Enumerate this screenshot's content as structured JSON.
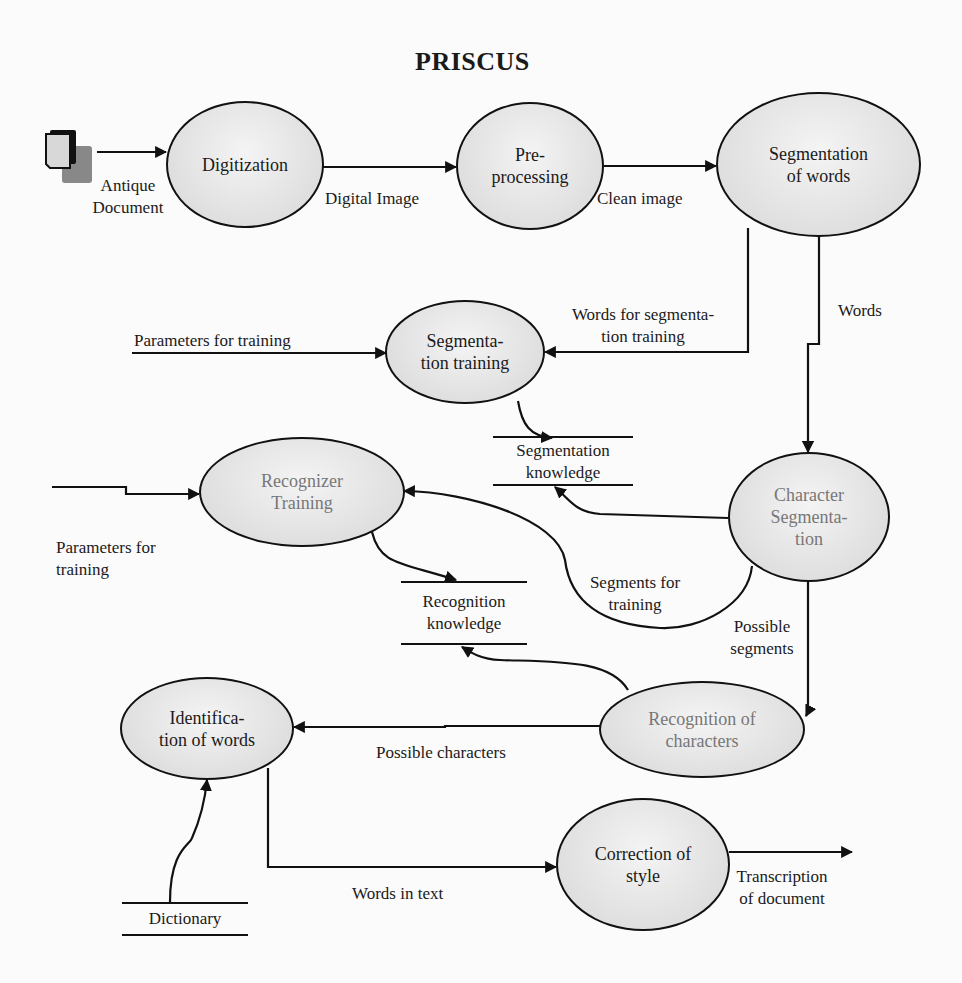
{
  "diagram": {
    "title": "PRISCUS",
    "nodes": {
      "digitization": "Digitization",
      "preprocessing": "Pre-\nprocessing",
      "segmentation_of_words": "Segmentation\nof words",
      "segmentation_training": "Segmenta-\ntion training",
      "recognizer_training": "Recognizer\nTraining",
      "character_segmentation": "Character\nSegmenta-\ntion",
      "recognition_of_characters": "Recognition of\ncharacters",
      "identification_of_words": "Identifica-\ntion of words",
      "correction_of_style": "Correction of\nstyle"
    },
    "stores": {
      "segmentation_knowledge": "Segmentation\nknowledge",
      "recognition_knowledge": "Recognition\nknowledge",
      "dictionary": "Dictionary"
    },
    "edge_labels": {
      "antique_document": "Antique\nDocument",
      "digital_image": "Digital Image",
      "clean_image": "Clean image",
      "words_for_segmentation_training": "Words for segmenta-\ntion training",
      "words": "Words",
      "parameters_for_training_top": "Parameters for training",
      "parameters_for_training_left": "Parameters for\ntraining",
      "segments_for_training": "Segments for\ntraining",
      "possible_segments": "Possible\nsegments",
      "possible_characters": "Possible characters",
      "words_in_text": "Words in text",
      "transcription_of_document": "Transcription\nof document"
    },
    "icons": {
      "source": "document-stack-icon"
    },
    "colors": {
      "node_fill": "#e2e2e2",
      "stroke": "#111111",
      "muted_node_text": "#777777",
      "background": "#fbfbfb"
    }
  }
}
